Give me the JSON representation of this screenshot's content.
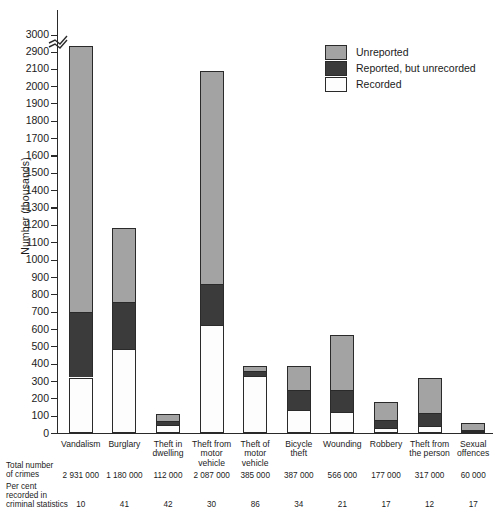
{
  "chart_data": {
    "type": "bar",
    "subtype": "stacked-bar",
    "title": "",
    "xlabel": "",
    "ylabel": "Number (thousands)",
    "ylim": [
      0,
      3000
    ],
    "axis_break": {
      "from": 2100,
      "to": 2900,
      "label": "axis-break-zigzag"
    },
    "yticks": [
      0,
      100,
      200,
      300,
      400,
      500,
      600,
      700,
      800,
      900,
      1000,
      1100,
      1200,
      1300,
      1400,
      1500,
      1600,
      1700,
      1800,
      1900,
      2000,
      2100,
      2900,
      3000
    ],
    "grid": false,
    "legend_position": "top-right",
    "categories": [
      "Vandalism",
      "Burglary",
      "Theft in dwelling",
      "Theft from motor vehicle",
      "Theft of motor vehicle",
      "Bicycle theft",
      "Wounding",
      "Robbery",
      "Theft from the person",
      "Sexual offences"
    ],
    "category_labels_wrapped": [
      "Vandalism",
      "Burglary",
      "Theft in\ndwelling",
      "Theft from\nmotor\nvehicle",
      "Theft of\nmotor\nvehicle",
      "Bicycle\ntheft",
      "Wounding",
      "Robbery",
      "Theft from\nthe person",
      "Sexual\noffences"
    ],
    "series": [
      {
        "name": "Recorded",
        "color": "#fdfdfd",
        "values": [
          320,
          485,
          47,
          625,
          331,
          132,
          120,
          30,
          38,
          10
        ]
      },
      {
        "name": "Reported, but unrecorded",
        "color": "#3b3b3b",
        "values": [
          380,
          270,
          22,
          235,
          29,
          118,
          130,
          45,
          77,
          8
        ]
      },
      {
        "name": "Unreported",
        "color": "#a3a3a3",
        "values": [
          2231,
          425,
          43,
          1227,
          25,
          137,
          316,
          102,
          202,
          42
        ]
      }
    ],
    "totals": [
      2931,
      1180,
      112,
      2087,
      385,
      387,
      566,
      177,
      317,
      60
    ]
  },
  "legend": {
    "items": [
      {
        "label": "Unreported",
        "color": "#a3a3a3"
      },
      {
        "label": "Reported, but unrecorded",
        "color": "#3b3b3b"
      },
      {
        "label": "Recorded",
        "color": "#fdfdfd"
      }
    ]
  },
  "axis": {
    "ylabel": "Number (thousands)",
    "ticks": [
      "3000",
      "2900",
      "2100",
      "2000",
      "1900",
      "1800",
      "1700",
      "1600",
      "1500",
      "1400",
      "1300",
      "1200",
      "1100",
      "1000",
      "900",
      "800",
      "700",
      "600",
      "500",
      "400",
      "300",
      "200",
      "100",
      "0"
    ]
  },
  "bottom_table": {
    "rows": [
      {
        "title": "Total number\nof crimes",
        "values": [
          "2 931 000",
          "1 180 000",
          "112 000",
          "2 087 000",
          "385 000",
          "387 000",
          "566 000",
          "177 000",
          "317 000",
          "60 000"
        ]
      },
      {
        "title": "Per cent\nrecorded in\ncriminal statistics",
        "values": [
          "10",
          "41",
          "42",
          "30",
          "86",
          "34",
          "21",
          "17",
          "12",
          "17"
        ]
      }
    ]
  },
  "colors": {
    "unreported": "#a3a3a3",
    "unrecorded": "#3b3b3b",
    "recorded": "#fdfdfd",
    "axis": "#2a2a2a",
    "text": "#1b1b1b",
    "background": "#ffffff"
  }
}
